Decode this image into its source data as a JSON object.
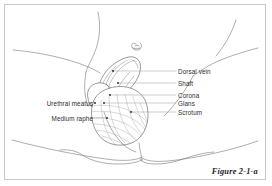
{
  "figure": {
    "caption": "Figure 2-1-a",
    "border_color": "#c9c9c9",
    "background_color": "#ffffff",
    "line_color": "#55555a",
    "leader_line_color": "#9a9a9a",
    "text_color": "#2b2b2b"
  },
  "labels_right": [
    {
      "id": "dorsal-vein",
      "text": "Dorsal vein",
      "text_x": 178,
      "text_y": 68,
      "leader_x1": 113,
      "leader_x2": 176,
      "leader_y": 71
    },
    {
      "id": "shaft",
      "text": "Shaft",
      "text_x": 178,
      "text_y": 80,
      "leader_x1": 118,
      "leader_x2": 176,
      "leader_y": 83
    },
    {
      "id": "corona",
      "text": "Corona",
      "text_x": 178,
      "text_y": 92,
      "leader_x1": 110,
      "leader_x2": 176,
      "leader_y": 95
    },
    {
      "id": "glans",
      "text": "Glans",
      "text_x": 178,
      "text_y": 100,
      "leader_x1": 104,
      "leader_x2": 176,
      "leader_y": 103
    },
    {
      "id": "scrotum",
      "text": "Scrotum",
      "text_x": 178,
      "text_y": 109,
      "leader_x1": 131,
      "leader_x2": 176,
      "leader_y": 112
    }
  ],
  "labels_left": [
    {
      "id": "urethral-meatus",
      "text": "Urethral meatus",
      "text_right_x": 93,
      "text_y": 100,
      "leader_x1": 95,
      "leader_x2": 92,
      "leader_y": 103
    },
    {
      "id": "medium-raphe",
      "text": "Medium raphe",
      "text_right_x": 93,
      "text_y": 115,
      "leader_x1": 107,
      "leader_x2": 92,
      "leader_y": 118
    }
  ],
  "annotation_dots": [
    {
      "id": "dot-dorsal-vein",
      "x": 113,
      "y": 71
    },
    {
      "id": "dot-shaft",
      "x": 118,
      "y": 83
    },
    {
      "id": "dot-corona",
      "x": 110,
      "y": 95
    },
    {
      "id": "dot-glans",
      "x": 104,
      "y": 103
    },
    {
      "id": "dot-scrotum",
      "x": 131,
      "y": 112
    },
    {
      "id": "dot-urethral-meatus",
      "x": 95,
      "y": 103
    },
    {
      "id": "dot-medium-raphe",
      "x": 107,
      "y": 118
    }
  ]
}
